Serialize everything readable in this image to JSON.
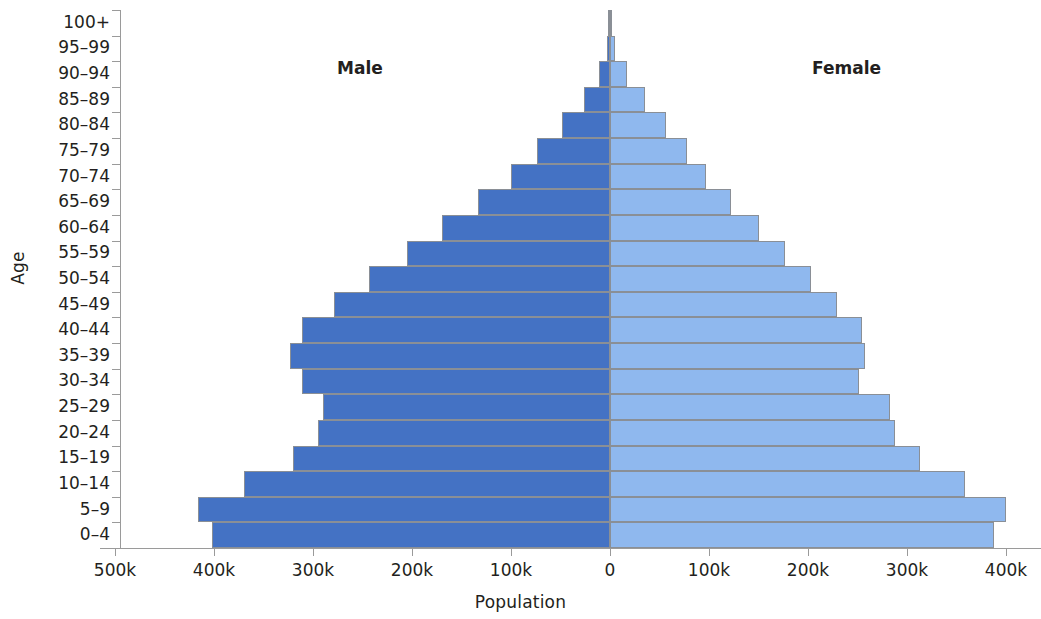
{
  "chart_data": {
    "type": "bar",
    "subtype": "population-pyramid",
    "title": "",
    "xlabel": "Population",
    "ylabel": "Age",
    "orientation": "horizontal",
    "grid": false,
    "legend_position": "inside-top",
    "categories": [
      "0–4",
      "5–9",
      "10–14",
      "15–19",
      "20–24",
      "25–29",
      "30–34",
      "35–39",
      "40–44",
      "45–49",
      "50–54",
      "55–59",
      "60–64",
      "65–69",
      "70–74",
      "75–79",
      "80–84",
      "85–89",
      "90–94",
      "95–99",
      "100+"
    ],
    "series": [
      {
        "name": "Male",
        "color": "#4472c4",
        "side": "left",
        "values": [
          402000,
          416000,
          370000,
          320000,
          295000,
          290000,
          311000,
          323000,
          311000,
          279000,
          243000,
          205000,
          170000,
          133000,
          100000,
          74000,
          48000,
          26000,
          11000,
          3000,
          500
        ]
      },
      {
        "name": "Female",
        "color": "#8fb8ee",
        "side": "right",
        "values": [
          388000,
          400000,
          359000,
          313000,
          288000,
          283000,
          252000,
          258000,
          255000,
          229000,
          203000,
          177000,
          150000,
          122000,
          97000,
          78000,
          57000,
          35000,
          17000,
          5000,
          800
        ]
      }
    ],
    "x_ticks": [
      {
        "label": "500k",
        "value": -500000
      },
      {
        "label": "400k",
        "value": -400000
      },
      {
        "label": "300k",
        "value": -300000
      },
      {
        "label": "200k",
        "value": -200000
      },
      {
        "label": "100k",
        "value": -100000
      },
      {
        "label": "0",
        "value": 0
      },
      {
        "label": "100k",
        "value": 100000
      },
      {
        "label": "200k",
        "value": 200000
      },
      {
        "label": "300k",
        "value": 300000
      },
      {
        "label": "400k",
        "value": 400000
      }
    ],
    "xlim": [
      -520000,
      420000
    ],
    "axis_color": "#9a9a9a",
    "bar_border_color": "#8a8f96"
  }
}
